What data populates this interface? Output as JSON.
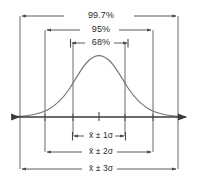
{
  "figure": {
    "background_color": "#ffffff",
    "line_color": "#4a4a4a",
    "curve_color": "#6b6b6b",
    "text_color": "#2a2a2a"
  },
  "percent_brackets": [
    {
      "label": "99.7%",
      "x_left": 20,
      "x_right": 178,
      "y": 16
    },
    {
      "label": "95%",
      "x_left": 45,
      "x_right": 153,
      "y": 30
    },
    {
      "label": "68%",
      "x_left": 70,
      "x_right": 128,
      "y": 43
    }
  ],
  "sigma_brackets": [
    {
      "label": "x̄ ± 1σ",
      "x_left": 73,
      "x_right": 125,
      "y": 136
    },
    {
      "label": "x̄ ± 2σ",
      "x_left": 45,
      "x_right": 153,
      "y": 152
    },
    {
      "label": "x̄ ± 3σ",
      "x_left": 20,
      "x_right": 178,
      "y": 169
    }
  ],
  "axis": {
    "y": 117,
    "x_start": 8,
    "x_end": 190,
    "center_tick_x": 99,
    "tick_positions": [
      45,
      73,
      99,
      125,
      153
    ]
  },
  "curve": {
    "mean_x": 99,
    "peak_y": 56,
    "baseline_y": 117,
    "sigma_px": 26,
    "description": "bell-shaped normal density curve"
  },
  "chart_data": {
    "type": "line",
    "title": "",
    "xlabel": "",
    "ylabel": "",
    "categories": [
      "x̄ ± 1σ",
      "x̄ ± 2σ",
      "x̄ ± 3σ"
    ],
    "values": [
      68,
      95,
      99.7
    ],
    "annotations": [
      "68%",
      "95%",
      "99.7%"
    ]
  }
}
